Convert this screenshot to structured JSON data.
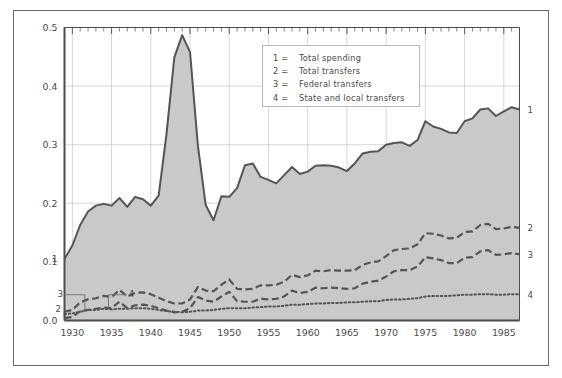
{
  "chart_data": {
    "type": "area",
    "title": "",
    "xlabel": "",
    "ylabel": "",
    "xlim": [
      1929,
      1987
    ],
    "ylim": [
      0.0,
      0.5
    ],
    "grid": true,
    "legend_position": "upper-center-right",
    "x_tick_labels": [
      "1930",
      "1935",
      "1940",
      "1945",
      "1950",
      "1955",
      "1960",
      "1965",
      "1970",
      "1975",
      "1980",
      "1985"
    ],
    "x_tick_values": [
      1930,
      1935,
      1940,
      1945,
      1950,
      1955,
      1960,
      1965,
      1970,
      1975,
      1980,
      1985
    ],
    "y_tick_labels": [
      "0.0",
      "0.1",
      "0.2",
      "0.3",
      "0.4",
      "0.5"
    ],
    "y_tick_values": [
      0.0,
      0.1,
      0.2,
      0.3,
      0.4,
      0.5
    ],
    "x": [
      1929,
      1930,
      1931,
      1932,
      1933,
      1934,
      1935,
      1936,
      1937,
      1938,
      1939,
      1940,
      1941,
      1942,
      1943,
      1944,
      1945,
      1946,
      1947,
      1948,
      1949,
      1950,
      1951,
      1952,
      1953,
      1954,
      1955,
      1956,
      1957,
      1958,
      1959,
      1960,
      1961,
      1962,
      1963,
      1964,
      1965,
      1966,
      1967,
      1968,
      1969,
      1970,
      1971,
      1972,
      1973,
      1974,
      1975,
      1976,
      1977,
      1978,
      1979,
      1980,
      1981,
      1982,
      1983,
      1984,
      1985,
      1986,
      1987
    ],
    "series": [
      {
        "name": "Total spending",
        "label": "1",
        "style": "solid-filled-area",
        "color": "#555555",
        "fill": "#c9c9c9",
        "values": [
          0.105,
          0.128,
          0.163,
          0.186,
          0.196,
          0.199,
          0.196,
          0.209,
          0.194,
          0.211,
          0.207,
          0.196,
          0.213,
          0.318,
          0.449,
          0.487,
          0.458,
          0.299,
          0.197,
          0.171,
          0.212,
          0.211,
          0.226,
          0.265,
          0.268,
          0.245,
          0.24,
          0.234,
          0.248,
          0.262,
          0.25,
          0.254,
          0.264,
          0.265,
          0.264,
          0.261,
          0.255,
          0.268,
          0.285,
          0.288,
          0.289,
          0.3,
          0.303,
          0.304,
          0.298,
          0.308,
          0.34,
          0.331,
          0.327,
          0.321,
          0.32,
          0.34,
          0.345,
          0.36,
          0.362,
          0.349,
          0.357,
          0.364,
          0.36
        ]
      },
      {
        "name": "Total transfers",
        "label": "2",
        "style": "dashed",
        "color": "#555555",
        "values": [
          0.015,
          0.018,
          0.031,
          0.036,
          0.038,
          0.042,
          0.04,
          0.052,
          0.041,
          0.047,
          0.048,
          0.045,
          0.039,
          0.033,
          0.029,
          0.029,
          0.036,
          0.057,
          0.051,
          0.05,
          0.061,
          0.07,
          0.054,
          0.053,
          0.054,
          0.06,
          0.06,
          0.061,
          0.066,
          0.078,
          0.074,
          0.077,
          0.085,
          0.084,
          0.086,
          0.085,
          0.085,
          0.086,
          0.095,
          0.099,
          0.101,
          0.11,
          0.12,
          0.122,
          0.123,
          0.13,
          0.149,
          0.148,
          0.145,
          0.14,
          0.141,
          0.151,
          0.152,
          0.163,
          0.165,
          0.156,
          0.157,
          0.16,
          0.158
        ]
      },
      {
        "name": "Federal transfers",
        "label": "3",
        "style": "dashed",
        "color": "#555555",
        "values": [
          0.004,
          0.006,
          0.016,
          0.018,
          0.02,
          0.022,
          0.021,
          0.032,
          0.021,
          0.026,
          0.027,
          0.025,
          0.021,
          0.017,
          0.014,
          0.015,
          0.021,
          0.04,
          0.034,
          0.032,
          0.041,
          0.049,
          0.033,
          0.032,
          0.032,
          0.037,
          0.036,
          0.037,
          0.041,
          0.051,
          0.047,
          0.049,
          0.056,
          0.055,
          0.056,
          0.055,
          0.054,
          0.055,
          0.063,
          0.066,
          0.068,
          0.075,
          0.084,
          0.086,
          0.086,
          0.092,
          0.108,
          0.106,
          0.103,
          0.098,
          0.098,
          0.107,
          0.108,
          0.118,
          0.12,
          0.112,
          0.113,
          0.115,
          0.113
        ]
      },
      {
        "name": "State and local transfers",
        "label": "4",
        "style": "dotted",
        "color": "#555555",
        "values": [
          0.011,
          0.012,
          0.015,
          0.018,
          0.018,
          0.02,
          0.019,
          0.02,
          0.02,
          0.021,
          0.021,
          0.02,
          0.018,
          0.016,
          0.015,
          0.014,
          0.015,
          0.017,
          0.017,
          0.018,
          0.02,
          0.021,
          0.021,
          0.021,
          0.022,
          0.023,
          0.024,
          0.024,
          0.025,
          0.027,
          0.027,
          0.028,
          0.029,
          0.029,
          0.03,
          0.03,
          0.031,
          0.031,
          0.032,
          0.033,
          0.033,
          0.035,
          0.036,
          0.036,
          0.037,
          0.038,
          0.041,
          0.042,
          0.042,
          0.042,
          0.043,
          0.044,
          0.044,
          0.045,
          0.045,
          0.044,
          0.044,
          0.045,
          0.045
        ]
      }
    ],
    "annotations_left": [
      {
        "label": "1",
        "x": 1929,
        "y": 0.105
      },
      {
        "label": "2",
        "x": 1929,
        "y": 0.02
      },
      {
        "label": "3",
        "x": 1930,
        "y": 0.04,
        "leader": true
      },
      {
        "label": "4",
        "x": 1936,
        "y": 0.04,
        "leader": true
      }
    ],
    "annotations_right": [
      {
        "label": "1",
        "x": 1987,
        "y": 0.36
      },
      {
        "label": "2",
        "x": 1987,
        "y": 0.158
      },
      {
        "label": "3",
        "x": 1987,
        "y": 0.113
      },
      {
        "label": "4",
        "x": 1987,
        "y": 0.045
      }
    ]
  },
  "legend": {
    "entries": [
      {
        "key": "1  =",
        "label": "Total spending"
      },
      {
        "key": "2  =",
        "label": "Total transfers"
      },
      {
        "key": "3  =",
        "label": "Federal transfers"
      },
      {
        "key": "4  =",
        "label": "State and local transfers"
      }
    ]
  },
  "colors": {
    "line": "#555555",
    "area_fill": "#c9c9c9",
    "grid": "#c4c4c4",
    "axis": "#4d4d4d",
    "frame": "#6b6b6b",
    "text": "#4a4a4a"
  }
}
